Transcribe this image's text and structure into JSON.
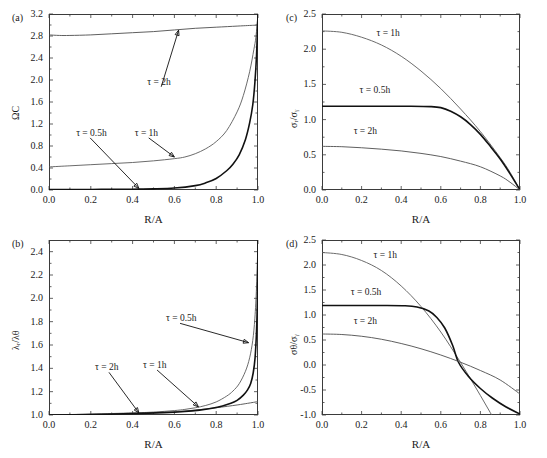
{
  "figure": {
    "width": 547,
    "height": 458,
    "background": "#ffffff",
    "axis_color": "#3b3b3b",
    "panels": [
      "a",
      "b",
      "c",
      "d"
    ]
  },
  "labels": {
    "panel_a": "(a)",
    "panel_b": "(b)",
    "panel_c": "(c)",
    "panel_d": "(d)",
    "xaxis": "R/A",
    "tau_05h": "τ = 0.5h",
    "tau_1h": "τ = 1h",
    "tau_2h": "τ = 2h"
  },
  "chart_data": [
    {
      "id": "panel-a",
      "type": "line",
      "title": "(a)",
      "xlabel": "R/A",
      "ylabel": "ΩC",
      "xlim": [
        0.0,
        1.0
      ],
      "ylim": [
        0.0,
        3.2
      ],
      "xticks": [
        "0.0",
        "0.2",
        "0.4",
        "0.6",
        "0.8",
        "1.0"
      ],
      "xtick_values": [
        0.0,
        0.2,
        0.4,
        0.6,
        0.8,
        1.0
      ],
      "yticks": [
        "0.0",
        "0.4",
        "0.8",
        "1.2",
        "1.6",
        "2.0",
        "2.4",
        "2.8",
        "3.2"
      ],
      "ytick_values": [
        0.0,
        0.4,
        0.8,
        1.2,
        1.6,
        2.0,
        2.4,
        2.8,
        3.2
      ],
      "grid": false,
      "legend": "annotations-with-arrows",
      "series": [
        {
          "name": "τ = 2h",
          "color": "#4d4d4d",
          "width": 0.9,
          "x": [
            0.0,
            0.05,
            0.1,
            0.2,
            0.3,
            0.4,
            0.5,
            0.6,
            0.7,
            0.8,
            0.9,
            0.95,
            0.98,
            1.0
          ],
          "y": [
            2.82,
            2.81,
            2.81,
            2.82,
            2.84,
            2.86,
            2.88,
            2.91,
            2.94,
            2.96,
            2.98,
            2.99,
            2.995,
            3.0
          ]
        },
        {
          "name": "τ = 1h",
          "color": "#5a5a5a",
          "width": 0.9,
          "x": [
            0.0,
            0.1,
            0.2,
            0.3,
            0.4,
            0.5,
            0.6,
            0.65,
            0.7,
            0.75,
            0.8,
            0.85,
            0.9,
            0.93,
            0.96,
            0.98,
            0.99,
            1.0
          ],
          "y": [
            0.42,
            0.44,
            0.46,
            0.48,
            0.5,
            0.53,
            0.57,
            0.6,
            0.66,
            0.75,
            0.88,
            1.08,
            1.42,
            1.72,
            2.15,
            2.55,
            2.78,
            3.2
          ]
        },
        {
          "name": "τ = 0.5h",
          "color": "#111111",
          "width": 1.6,
          "x": [
            0.0,
            0.1,
            0.2,
            0.3,
            0.4,
            0.5,
            0.6,
            0.7,
            0.75,
            0.8,
            0.85,
            0.88,
            0.91,
            0.94,
            0.96,
            0.975,
            0.985,
            0.993,
            1.0
          ],
          "y": [
            0.01,
            0.01,
            0.01,
            0.012,
            0.015,
            0.02,
            0.035,
            0.08,
            0.13,
            0.21,
            0.35,
            0.47,
            0.64,
            0.92,
            1.22,
            1.55,
            1.95,
            2.45,
            3.2
          ]
        }
      ],
      "annotations": [
        {
          "text": "τ = 2h",
          "x": 0.47,
          "y": 1.95,
          "arrow_to": {
            "x": 0.62,
            "y": 2.905
          }
        },
        {
          "text": "τ = 1h",
          "x": 0.41,
          "y": 1.02,
          "arrow_to": {
            "x": 0.6,
            "y": 0.6
          }
        },
        {
          "text": "τ = 0.5h",
          "x": 0.13,
          "y": 1.02,
          "arrow_to": {
            "x": 0.43,
            "y": 0.03
          }
        }
      ]
    },
    {
      "id": "panel-b",
      "type": "line",
      "title": "(b)",
      "xlabel": "R/A",
      "ylabel": "λᵣ/λθ",
      "xlim": [
        0.0,
        1.0
      ],
      "ylim": [
        1.0,
        2.5
      ],
      "xticks": [
        "0.0",
        "0.2",
        "0.4",
        "0.6",
        "0.8",
        "1.0"
      ],
      "xtick_values": [
        0.0,
        0.2,
        0.4,
        0.6,
        0.8,
        1.0
      ],
      "yticks": [
        "1.0",
        "1.2",
        "1.4",
        "1.6",
        "1.8",
        "2.0",
        "2.2",
        "2.4"
      ],
      "ytick_values": [
        1.0,
        1.2,
        1.4,
        1.6,
        1.8,
        2.0,
        2.2,
        2.4
      ],
      "grid": false,
      "legend": "annotations-with-arrows",
      "series": [
        {
          "name": "τ = 2h",
          "color": "#4d4d4d",
          "width": 0.9,
          "x": [
            0.0,
            0.2,
            0.4,
            0.5,
            0.6,
            0.7,
            0.8,
            0.9,
            0.95,
            1.0
          ],
          "y": [
            1.0,
            1.005,
            1.012,
            1.018,
            1.028,
            1.042,
            1.062,
            1.086,
            1.1,
            1.115
          ]
        },
        {
          "name": "τ = 1h",
          "color": "#5a5a5a",
          "width": 0.9,
          "x": [
            0.0,
            0.2,
            0.4,
            0.5,
            0.6,
            0.65,
            0.7,
            0.75,
            0.8,
            0.85,
            0.88,
            0.91,
            0.94,
            0.96,
            0.975,
            0.985,
            0.993,
            1.0
          ],
          "y": [
            1.0,
            1.008,
            1.018,
            1.025,
            1.038,
            1.048,
            1.062,
            1.082,
            1.112,
            1.162,
            1.205,
            1.268,
            1.375,
            1.49,
            1.64,
            1.83,
            2.1,
            2.5
          ]
        },
        {
          "name": "τ = 0.5h",
          "color": "#111111",
          "width": 1.6,
          "x": [
            0.0,
            0.2,
            0.4,
            0.55,
            0.65,
            0.72,
            0.78,
            0.83,
            0.87,
            0.9,
            0.93,
            0.95,
            0.965,
            0.977,
            0.986,
            0.993,
            0.997,
            1.0
          ],
          "y": [
            1.0,
            1.004,
            1.012,
            1.02,
            1.03,
            1.042,
            1.058,
            1.078,
            1.1,
            1.125,
            1.17,
            1.215,
            1.27,
            1.36,
            1.49,
            1.72,
            1.98,
            2.5
          ]
        }
      ],
      "annotations": [
        {
          "text": "τ = 0.5h",
          "x": 0.56,
          "y": 1.82,
          "arrow_to": {
            "x": 0.955,
            "y": 1.62
          }
        },
        {
          "text": "τ = 1h",
          "x": 0.45,
          "y": 1.42,
          "arrow_to": {
            "x": 0.715,
            "y": 1.07
          }
        },
        {
          "text": "τ = 2h",
          "x": 0.22,
          "y": 1.4,
          "arrow_to": {
            "x": 0.43,
            "y": 1.018
          }
        }
      ]
    },
    {
      "id": "panel-c",
      "type": "line",
      "title": "(c)",
      "xlabel": "R/A",
      "ylabel": "σᵣ/σᵧ",
      "xlim": [
        0.0,
        1.0
      ],
      "ylim": [
        0.0,
        2.5
      ],
      "xticks": [
        "0.0",
        "0.2",
        "0.4",
        "0.6",
        "0.8",
        "1.0"
      ],
      "xtick_values": [
        0.0,
        0.2,
        0.4,
        0.6,
        0.8,
        1.0
      ],
      "yticks": [
        "0.0",
        "0.5",
        "1.0",
        "1.5",
        "2.0",
        "2.5"
      ],
      "ytick_values": [
        0.0,
        0.5,
        1.0,
        1.5,
        2.0,
        2.5
      ],
      "grid": false,
      "legend": "inline-text",
      "series": [
        {
          "name": "τ = 1h",
          "color": "#5a5a5a",
          "width": 0.9,
          "x": [
            0.0,
            0.1,
            0.2,
            0.3,
            0.4,
            0.5,
            0.6,
            0.7,
            0.8,
            0.9,
            0.95,
            1.0
          ],
          "y": [
            2.26,
            2.24,
            2.17,
            2.06,
            1.9,
            1.69,
            1.44,
            1.15,
            0.83,
            0.46,
            0.25,
            0.0
          ]
        },
        {
          "name": "τ = 0.5h",
          "color": "#111111",
          "width": 1.6,
          "x": [
            0.0,
            0.15,
            0.3,
            0.45,
            0.55,
            0.6,
            0.65,
            0.7,
            0.75,
            0.8,
            0.85,
            0.9,
            0.95,
            1.0
          ],
          "y": [
            1.19,
            1.19,
            1.19,
            1.19,
            1.185,
            1.17,
            1.12,
            1.04,
            0.93,
            0.79,
            0.62,
            0.44,
            0.23,
            0.0
          ]
        },
        {
          "name": "τ = 2h",
          "color": "#4d4d4d",
          "width": 0.9,
          "x": [
            0.0,
            0.1,
            0.2,
            0.3,
            0.4,
            0.5,
            0.6,
            0.7,
            0.8,
            0.9,
            0.95,
            1.0
          ],
          "y": [
            0.62,
            0.615,
            0.6,
            0.58,
            0.555,
            0.52,
            0.475,
            0.41,
            0.33,
            0.2,
            0.11,
            0.0
          ]
        }
      ],
      "annotations": [
        {
          "text": "τ = 1h",
          "x": 0.275,
          "y": 2.21
        },
        {
          "text": "τ = 0.5h",
          "x": 0.19,
          "y": 1.4
        },
        {
          "text": "τ = 2h",
          "x": 0.16,
          "y": 0.83
        }
      ]
    },
    {
      "id": "panel-d",
      "type": "line",
      "title": "(d)",
      "xlabel": "R/A",
      "ylabel": "σθ/σᵧ",
      "xlim": [
        0.0,
        1.0
      ],
      "ylim": [
        -1.0,
        2.5
      ],
      "xticks": [
        "0.0",
        "0.2",
        "0.4",
        "0.6",
        "0.8",
        "1.0"
      ],
      "xtick_values": [
        0.0,
        0.2,
        0.4,
        0.6,
        0.8,
        1.0
      ],
      "yticks": [
        "-1.0",
        "-0.5",
        "0.0",
        "0.5",
        "1.0",
        "1.5",
        "2.0",
        "2.5"
      ],
      "ytick_values": [
        -1.0,
        -0.5,
        0.0,
        0.5,
        1.0,
        1.5,
        2.0,
        2.5
      ],
      "grid": false,
      "legend": "inline-text",
      "series": [
        {
          "name": "τ = 1h",
          "color": "#5a5a5a",
          "width": 0.9,
          "x": [
            0.0,
            0.1,
            0.2,
            0.3,
            0.4,
            0.5,
            0.6,
            0.7,
            0.8,
            0.9,
            1.0
          ],
          "y": [
            2.25,
            2.21,
            2.09,
            1.89,
            1.58,
            1.17,
            0.66,
            0.05,
            -0.61,
            -1.3,
            -2.0
          ]
        },
        {
          "name": "τ = 0.5h",
          "color": "#111111",
          "width": 1.6,
          "x": [
            0.0,
            0.15,
            0.3,
            0.42,
            0.48,
            0.54,
            0.58,
            0.62,
            0.66,
            0.69,
            0.74,
            0.8,
            0.86,
            0.93,
            1.0
          ],
          "y": [
            1.19,
            1.19,
            1.19,
            1.185,
            1.16,
            1.08,
            0.95,
            0.74,
            0.39,
            0.05,
            -0.23,
            -0.47,
            -0.66,
            -0.84,
            -0.98
          ]
        },
        {
          "name": "τ = 2h",
          "color": "#4d4d4d",
          "width": 0.9,
          "x": [
            0.0,
            0.1,
            0.2,
            0.3,
            0.4,
            0.5,
            0.6,
            0.7,
            0.8,
            0.9,
            1.0
          ],
          "y": [
            0.62,
            0.61,
            0.575,
            0.515,
            0.43,
            0.325,
            0.2,
            0.055,
            -0.11,
            -0.3,
            -0.58
          ]
        }
      ],
      "annotations": [
        {
          "text": "τ = 1h",
          "x": 0.26,
          "y": 2.18
        },
        {
          "text": "τ = 0.5h",
          "x": 0.145,
          "y": 1.44
        },
        {
          "text": "τ = 2h",
          "x": 0.16,
          "y": 0.86
        }
      ]
    }
  ]
}
